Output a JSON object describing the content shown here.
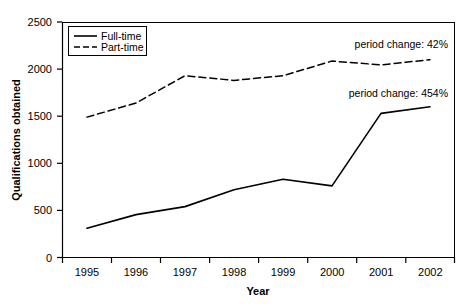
{
  "chart_data": {
    "type": "line",
    "title": "",
    "xlabel": "Year",
    "ylabel": "Qualifications obtained",
    "categories": [
      "1995",
      "1996",
      "1997",
      "1998",
      "1999",
      "2000",
      "2001",
      "2002"
    ],
    "series": [
      {
        "name": "Full-time",
        "style": "solid",
        "values": [
          310,
          455,
          540,
          720,
          830,
          760,
          1530,
          1600
        ]
      },
      {
        "name": "Part-time",
        "style": "dashed",
        "values": [
          1490,
          1640,
          1930,
          1880,
          1930,
          2085,
          2045,
          2100
        ]
      }
    ],
    "ylim": [
      0,
      2500
    ],
    "yticks": [
      0,
      500,
      1000,
      1500,
      2000,
      2500
    ],
    "ytick_labels": [
      "0",
      "500",
      "1000",
      "1500",
      "2000",
      "2500"
    ],
    "grid": false,
    "legend_position": "upper-left-inside",
    "annotations": [
      {
        "text": "period change: 42%",
        "series": "Part-time"
      },
      {
        "text": "period change: 454%",
        "series": "Full-time"
      }
    ],
    "colors": {
      "line": "#000000",
      "axis": "#000000",
      "background": "#ffffff"
    }
  },
  "axes": {
    "y_title": "Qualifications obtained",
    "x_title": "Year"
  },
  "legend": {
    "items": [
      {
        "label": "Full-time"
      },
      {
        "label": "Part-time"
      }
    ]
  },
  "annotations": {
    "part_time_change": "period change: 42%",
    "full_time_change": "period change: 454%"
  },
  "ticks": {
    "y": [
      "0",
      "500",
      "1000",
      "1500",
      "2000",
      "2500"
    ],
    "x": [
      "1995",
      "1996",
      "1997",
      "1998",
      "1999",
      "2000",
      "2001",
      "2002"
    ]
  }
}
